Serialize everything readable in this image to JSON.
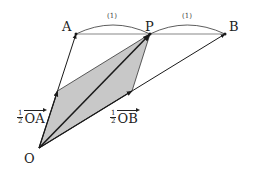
{
  "diagram": {
    "points": {
      "O": {
        "label": "O",
        "x": 39,
        "y": 148
      },
      "A": {
        "label": "A",
        "x": 76,
        "y": 34
      },
      "P": {
        "label": "P",
        "x": 150,
        "y": 34
      },
      "B": {
        "label": "B",
        "x": 225,
        "y": 34
      },
      "half_OA": {
        "x": 57.5,
        "y": 91
      },
      "half_OB": {
        "x": 132,
        "y": 91
      }
    },
    "ratio_labels": {
      "AP": "(1)",
      "PB": "(1)"
    },
    "vector_labels": {
      "half_OA": {
        "coef_num": "1",
        "coef_den": "2",
        "vector": "OA"
      },
      "half_OB": {
        "coef_num": "1",
        "coef_den": "2",
        "vector": "OB"
      }
    },
    "colors": {
      "line": "#1a1a1a",
      "fill": "#c8c8c8"
    }
  }
}
